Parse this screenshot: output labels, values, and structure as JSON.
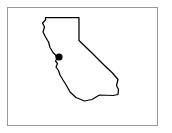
{
  "figure": {
    "title": "California state outline map with location marker",
    "background_color": "#ffffff"
  },
  "frame": {
    "name": "map-border",
    "stroke_color": "#9a9a9a",
    "fill_color": "#ffffff",
    "x": 7,
    "y": 7,
    "width": 151,
    "height": 119
  },
  "map": {
    "region_label": "California",
    "outline_color": "#000000",
    "outline_width": 1.25,
    "fill_color": "#ffffff",
    "outline_path": "M 45.5,17.5 L 79.0,17.5 L 79.0,40.5 L 92.0,53.0 L 103.5,64.5 L 112.5,73.0 L 118.0,79.5 L 116.5,85.5 L 118.5,89.5 L 118.0,94.5 L 113.0,95.5 L 99.5,95.0 L 92.0,99.5 L 84.5,101.0 L 76.0,97.5 L 70.0,92.0 L 66.5,85.5 L 63.0,80.0 L 60.0,75.0 L 58.5,70.5 L 56.0,67.0 L 57.5,63.5 L 55.5,61.0 L 57.0,58.5 L 56.0,55.5 L 53.0,52.5 L 50.0,47.5 L 48.5,42.0 L 45.5,37.0 L 43.0,32.0 L 44.5,27.0 L 42.5,23.0 L 45.5,20.0 Z"
  },
  "marker": {
    "label": "city-location-marker",
    "color": "#000000",
    "center_x": 59,
    "center_y": 57,
    "radius": 3.6
  }
}
